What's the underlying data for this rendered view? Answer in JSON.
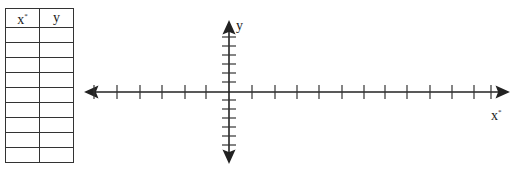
{
  "table": {
    "headers": [
      {
        "main": "x",
        "sup": "*"
      },
      {
        "main": "y",
        "sup": ""
      }
    ],
    "rows": [
      [
        "",
        ""
      ],
      [
        "",
        ""
      ],
      [
        "",
        ""
      ],
      [
        "",
        ""
      ],
      [
        "",
        ""
      ],
      [
        "",
        ""
      ],
      [
        "",
        ""
      ],
      [
        "",
        ""
      ],
      [
        "",
        ""
      ]
    ]
  },
  "graph": {
    "x_label": {
      "main": "x",
      "sup": "*"
    },
    "y_label": "y",
    "x_ticks_left": [
      94,
      117,
      140,
      162,
      185,
      206
    ],
    "x_ticks_right": [
      252,
      275,
      297,
      319,
      342,
      364,
      385,
      407,
      430,
      452,
      474,
      491
    ],
    "y_ticks_up": [
      37,
      46,
      55,
      64,
      73,
      82
    ],
    "y_ticks_down": [
      100,
      109,
      118,
      127,
      136,
      145
    ],
    "line_color": "#222222"
  }
}
